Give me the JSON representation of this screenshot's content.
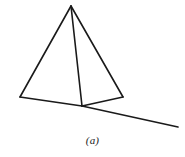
{
  "figure": {
    "caption": "(a)",
    "background_color": "#ffffff",
    "line_color": "#1a1a1a",
    "canvas": {
      "width": 185,
      "height": 157
    },
    "points": {
      "apex": {
        "x": 71,
        "y": 6
      },
      "base_left": {
        "x": 20,
        "y": 97
      },
      "base_right": {
        "x": 123,
        "y": 97
      },
      "base_junction": {
        "x": 82,
        "y": 106
      },
      "ground_right_end": {
        "x": 178,
        "y": 127
      }
    },
    "segments": [
      {
        "name": "left-edge",
        "from": "apex",
        "to": "base_left"
      },
      {
        "name": "right-edge",
        "from": "apex",
        "to": "base_right"
      },
      {
        "name": "center-edge",
        "from": "apex",
        "to": "base_junction"
      },
      {
        "name": "base-left-segment",
        "from": "base_left",
        "to": "base_junction"
      },
      {
        "name": "base-right-segment",
        "from": "base_junction",
        "to": "base_right"
      },
      {
        "name": "ground-line",
        "from": "base_junction",
        "to": "ground_right_end"
      }
    ]
  }
}
